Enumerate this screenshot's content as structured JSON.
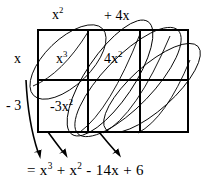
{
  "figure": {
    "kind": "algebra-box-multiplication-diagram",
    "background_color": "#ffffff",
    "ink_color": "#000000",
    "grid": {
      "columns": 3,
      "rows": 2,
      "left": 38,
      "top": 30,
      "right": 188,
      "bottom": 132,
      "vertical_dividers": [
        88,
        140
      ],
      "horizontal_dividers": [
        80
      ]
    }
  },
  "top_labels": [
    {
      "id": "x-squared",
      "text": "x",
      "exponent": "2"
    },
    {
      "id": "plus-four-x",
      "text": "+ 4x",
      "exponent": ""
    }
  ],
  "left_labels": [
    {
      "id": "x",
      "text": "x",
      "exponent": ""
    },
    {
      "id": "minus-three",
      "text": "- 3",
      "exponent": ""
    }
  ],
  "cells": [
    {
      "id": "x-cubed",
      "text": "x",
      "exponent": "3"
    },
    {
      "id": "four-x-squared",
      "text": "4x",
      "exponent": "2"
    },
    {
      "id": "minus-three-x-squared",
      "text": "-3x",
      "exponent": "2"
    }
  ],
  "result": {
    "prefix": "=",
    "terms": [
      {
        "coefficient": "x",
        "exponent": "3",
        "sign": ""
      },
      {
        "coefficient": "x",
        "exponent": "2",
        "sign": "+"
      },
      {
        "coefficient": "14x",
        "exponent": "",
        "sign": "-"
      },
      {
        "coefficient": "6",
        "exponent": "",
        "sign": "+"
      }
    ],
    "plain_text": "= x3 + x2 - 14x + 6"
  },
  "annotations": {
    "ellipse_count": 4,
    "arrow_count": 3,
    "arrow_direction": "down-left",
    "description": "Diagonal ovals group like terms along the box diagonals; arrows point down to the collected polynomial."
  }
}
